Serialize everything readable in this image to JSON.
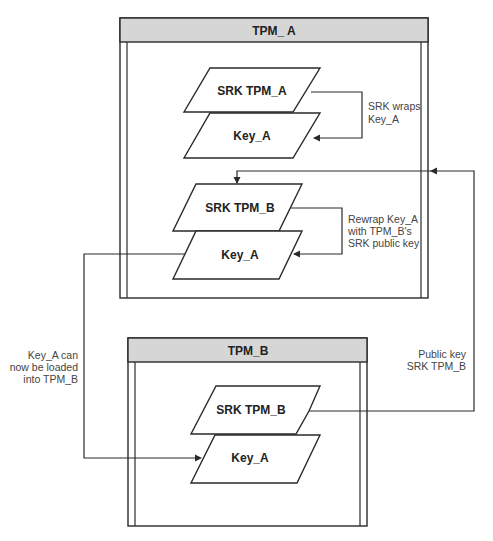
{
  "diagram": {
    "tpm_a": {
      "title": "TPM_ A",
      "upper_stack": {
        "top": "SRK TPM_A",
        "bottom": "Key_A"
      },
      "upper_note": [
        "SRK wraps",
        "Key_A"
      ],
      "lower_stack": {
        "top": "SRK TPM_B",
        "bottom": "Key_A"
      },
      "lower_note": [
        "Rewrap Key_A",
        "with TPM_B's",
        "SRK public key"
      ]
    },
    "tpm_b": {
      "title": "TPM_B",
      "stack": {
        "top": "SRK TPM_B",
        "bottom": "Key_A"
      }
    },
    "left_note": [
      "Key_A can",
      "now be loaded",
      "into TPM_B"
    ],
    "right_note": [
      "Public key",
      "SRK TPM_B"
    ],
    "colors": {
      "header_fill": "#d6d6d6",
      "stroke": "#2a2a2a",
      "background": "#ffffff"
    }
  }
}
